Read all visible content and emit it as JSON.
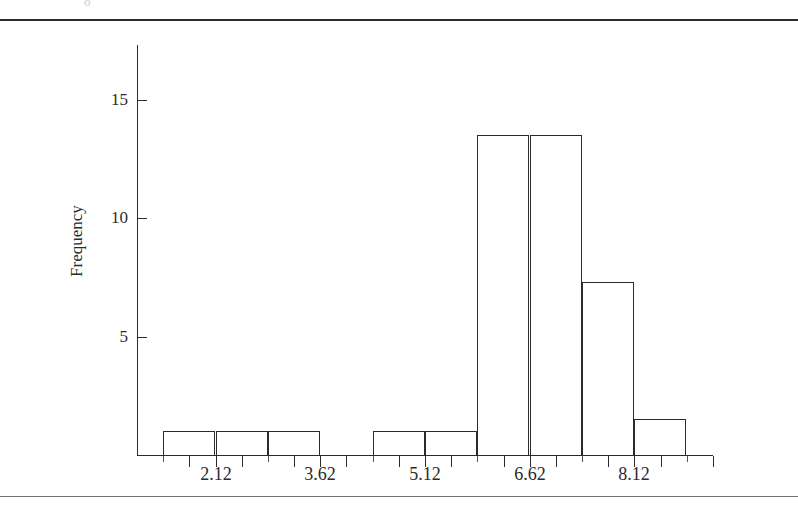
{
  "page": {
    "top_artifact_text": "o",
    "top_rule": "horizontal-rule",
    "bottom_rule": "horizontal-rule"
  },
  "chart_data": {
    "type": "bar",
    "subtype": "histogram",
    "title": "",
    "subtitle": "",
    "xlabel": "",
    "ylabel": "Frequency",
    "grid": false,
    "legend": null,
    "legend_position": "none",
    "xlim": [
      0.995,
      9.245
    ],
    "ylim": [
      0,
      17.3
    ],
    "x_tick_labels": [
      "2.12",
      "3.62",
      "5.12",
      "6.62",
      "8.12"
    ],
    "x_tick_values": [
      2.12,
      3.62,
      5.12,
      6.62,
      8.12
    ],
    "x_minor_tick_values": [
      1.37,
      2.87,
      4.37,
      5.87,
      7.37,
      8.87
    ],
    "x_major_tick_values": [
      1.745,
      2.495,
      3.245,
      3.995,
      4.745,
      5.495,
      6.245,
      6.995,
      7.745,
      8.495,
      9.245
    ],
    "y_tick_labels": [
      "5",
      "10",
      "15"
    ],
    "y_tick_values": [
      5,
      10,
      15
    ],
    "bin_width": 0.75,
    "bin_edges": [
      1.37,
      2.12,
      2.87,
      3.62,
      4.37,
      5.12,
      5.87,
      6.62,
      7.37,
      8.12,
      8.87
    ],
    "categories": [
      "1.37-2.12",
      "2.12-2.87",
      "2.87-3.62",
      "3.62-4.37",
      "4.37-5.12",
      "5.12-5.87",
      "5.87-6.62",
      "6.62-7.37",
      "7.37-8.12",
      "8.12-8.87"
    ],
    "values": [
      1,
      1,
      1,
      0,
      1,
      1,
      13.5,
      13.5,
      7.3,
      1.5
    ],
    "bars": [
      {
        "label": "1.37-2.12",
        "left": 1.37,
        "right": 2.12,
        "value": 1
      },
      {
        "label": "2.12-2.87",
        "left": 2.12,
        "right": 2.87,
        "value": 1
      },
      {
        "label": "2.87-3.62",
        "left": 2.87,
        "right": 3.62,
        "value": 1
      },
      {
        "label": "4.37-5.12",
        "left": 4.37,
        "right": 5.12,
        "value": 1
      },
      {
        "label": "5.12-5.87",
        "left": 5.12,
        "right": 5.87,
        "value": 1
      },
      {
        "label": "5.87-6.62",
        "left": 5.87,
        "right": 6.62,
        "value": 13.5
      },
      {
        "label": "6.62-7.37",
        "left": 6.62,
        "right": 7.37,
        "value": 13.5
      },
      {
        "label": "7.37-8.12",
        "left": 7.37,
        "right": 8.12,
        "value": 7.3
      },
      {
        "label": "8.12-8.87",
        "left": 8.12,
        "right": 8.87,
        "value": 1.5
      }
    ],
    "bar_style": {
      "fill": "none",
      "stroke": "#2b2b2b",
      "stroke_width": 1.6
    }
  }
}
